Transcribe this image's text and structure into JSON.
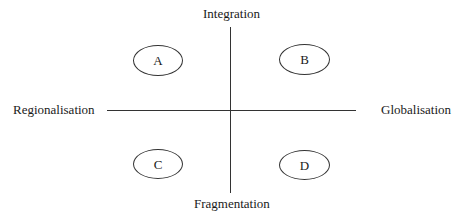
{
  "diagram": {
    "type": "quadrant",
    "axes": {
      "top": "Integration",
      "bottom": "Fragmentation",
      "left": "Regionalisation",
      "right": "Globalisation"
    },
    "quadrants": [
      {
        "id": "A",
        "label": "A",
        "position": "top-left"
      },
      {
        "id": "B",
        "label": "B",
        "position": "top-right"
      },
      {
        "id": "C",
        "label": "C",
        "position": "bottom-left"
      },
      {
        "id": "D",
        "label": "D",
        "position": "bottom-right"
      }
    ],
    "colors": {
      "line": "#333333",
      "text": "#1a1a1a",
      "background": "#ffffff"
    }
  }
}
